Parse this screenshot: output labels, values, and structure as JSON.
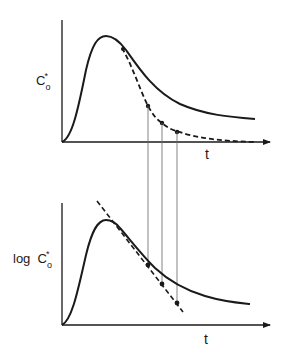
{
  "figure": {
    "top_panel": {
      "y_label": {
        "main": "C",
        "superscript": "*",
        "subscript": "o"
      },
      "x_label": "t",
      "curves": {
        "solid": "measured concentration C*o vs t (rise to peak, slow decay)",
        "dashed": "extrapolated fast-decay component"
      },
      "marked_points_count": 3
    },
    "bottom_panel": {
      "y_label": {
        "prefix": "log",
        "main": "C",
        "superscript": "*",
        "subscript": "o"
      },
      "x_label": "t",
      "curves": {
        "solid": "log C*o vs t",
        "dashed": "straight-line fit of log-linear decay"
      },
      "marked_points_count": 3
    },
    "connector_lines": 3,
    "colors": {
      "ink": "#1a1a1a",
      "guide": "#666666",
      "background": "#ffffff"
    }
  }
}
